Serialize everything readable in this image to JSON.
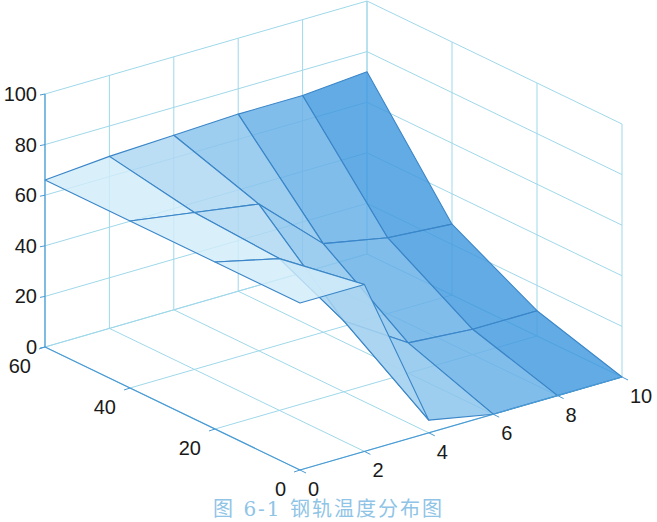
{
  "caption": "图 6-1  钢轨温度分布图",
  "colors": {
    "grid": "#9fd8ea",
    "axis": "#4a9ad4",
    "edge": "#3a86c8",
    "face_light": "#e3f6fc",
    "face_dark": "#2f8fdc"
  },
  "chart_data": {
    "type": "surface3d",
    "title": "",
    "xlabel": "",
    "ylabel": "",
    "zlabel": "",
    "x": [
      0,
      2,
      4,
      6,
      8,
      10
    ],
    "y": [
      0,
      20,
      40,
      60
    ],
    "z": [
      [
        66,
        66,
        5,
        0,
        0,
        0
      ],
      [
        66,
        60,
        28,
        12,
        10,
        10
      ],
      [
        66,
        62,
        58,
        35,
        30,
        28
      ],
      [
        66,
        68,
        69,
        70,
        70,
        72
      ]
    ],
    "xlim": [
      0,
      10
    ],
    "ylim": [
      0,
      60
    ],
    "zlim": [
      0,
      100
    ],
    "xticks": [
      "0",
      "2",
      "4",
      "6",
      "8",
      "10"
    ],
    "yticks": [
      "0",
      "20",
      "40",
      "60"
    ],
    "zticks": [
      "0",
      "20",
      "40",
      "60",
      "80",
      "100"
    ],
    "grid": true,
    "legend": null,
    "colormap": "light-cyan to blue along x"
  }
}
